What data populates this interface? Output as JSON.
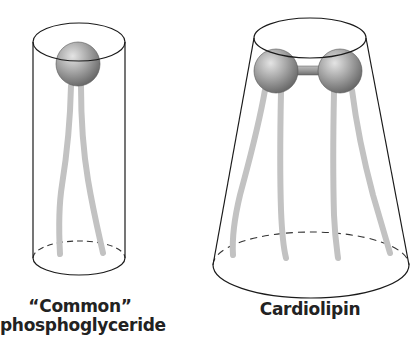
{
  "figure": {
    "panels": [
      {
        "id": "common",
        "label_line1": "“Common”",
        "label_line2": "phosphoglyceride",
        "shape": "cylinder",
        "head_groups": 1,
        "tails": 2
      },
      {
        "id": "cardiolipin",
        "label_line1": "Cardiolipin",
        "shape": "truncated cone",
        "head_groups": 2,
        "tails": 4
      }
    ],
    "colors": {
      "outline": "#1a1a1a",
      "tail": "#c4c4c4",
      "sphere_light": "#d8d8d8",
      "sphere_dark": "#6e6e6e"
    }
  }
}
